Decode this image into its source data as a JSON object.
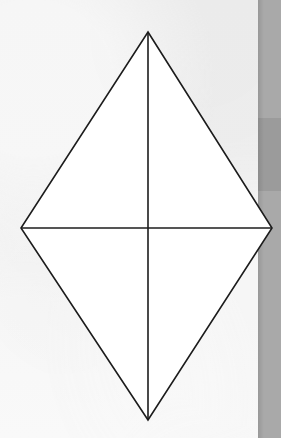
{
  "figure": {
    "title": "Rhombus with both diagonals drawn",
    "shape_name": "rhombus",
    "caption": "",
    "label": "",
    "fill_color": "#ffffff",
    "stroke_color": "#1c1c1c",
    "stroke_width": 1.6
  },
  "background": {
    "paper_color": "#efefef",
    "paper_color_bottom": "#f4f4f4",
    "edge_band_color": "#a9a9a9",
    "edge_band_dark_color": "#9b9b9b",
    "edge_band_x": 258,
    "edge_band_width": 23,
    "edge_band_dark_y": 118,
    "edge_band_dark_height": 73
  },
  "geometry": {
    "vertices": {
      "top": {
        "name": "top-vertex",
        "x": 148,
        "y": 32
      },
      "right": {
        "name": "right-vertex",
        "x": 272,
        "y": 228
      },
      "bottom": {
        "name": "bottom-vertex",
        "x": 148,
        "y": 420
      },
      "left": {
        "name": "left-vertex",
        "x": 21,
        "y": 228
      }
    },
    "outline_points": "148,32 272,228 148,420 21,228",
    "vertical_diagonal": {
      "x1": 148,
      "y1": 32,
      "x2": 148,
      "y2": 420
    },
    "horizontal_diagonal": {
      "x1": 21,
      "y1": 228,
      "x2": 272,
      "y2": 228
    },
    "center": {
      "x": 148,
      "y": 228
    }
  },
  "chart_data": {
    "type": "diagram",
    "title": "Rhombus with both diagonals drawn",
    "shape": "rhombus",
    "vertices": [
      {
        "label": "top",
        "x": 148,
        "y": 32
      },
      {
        "label": "right",
        "x": 272,
        "y": 228
      },
      {
        "label": "bottom",
        "x": 148,
        "y": 420
      },
      {
        "label": "left",
        "x": 21,
        "y": 228
      }
    ],
    "diagonals": [
      {
        "name": "vertical",
        "from": "top",
        "to": "bottom",
        "length_px": 388
      },
      {
        "name": "horizontal",
        "from": "left",
        "to": "right",
        "length_px": 251
      }
    ],
    "regions": 4,
    "grid": false,
    "legend": null,
    "annotations": []
  }
}
